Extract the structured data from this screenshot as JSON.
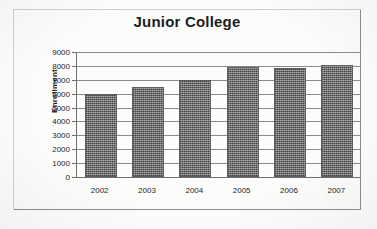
{
  "chart_data": {
    "type": "bar",
    "title": "Junior College",
    "xlabel": "",
    "ylabel": "Enrollment",
    "categories": [
      "2002",
      "2003",
      "2004",
      "2005",
      "2006",
      "2007"
    ],
    "values": [
      6000,
      6500,
      7000,
      7950,
      7850,
      8100
    ],
    "ylim": [
      0,
      9000
    ],
    "ytick_step": 1000,
    "yticks": [
      "9000",
      "8000",
      "7000",
      "6000",
      "5000",
      "4000",
      "3000",
      "2000",
      "1000",
      "0"
    ],
    "ytick_values": [
      9000,
      8000,
      7000,
      6000,
      5000,
      4000,
      3000,
      2000,
      1000,
      0
    ],
    "grid": true,
    "legend": false,
    "legend_position": "none",
    "series": [
      {
        "name": "Enrollment",
        "values": [
          6000,
          6500,
          7000,
          7950,
          7850,
          8100
        ]
      }
    ],
    "colors": {
      "bar_fill": "#8a8a8a",
      "bar_border": "#5e5e5e",
      "gridline": "#8b8b8b",
      "axis": "#6f6f6f",
      "text": "#1d1d1d",
      "background": "#fdfdfc",
      "frame_border": "#8e8e8e"
    }
  }
}
